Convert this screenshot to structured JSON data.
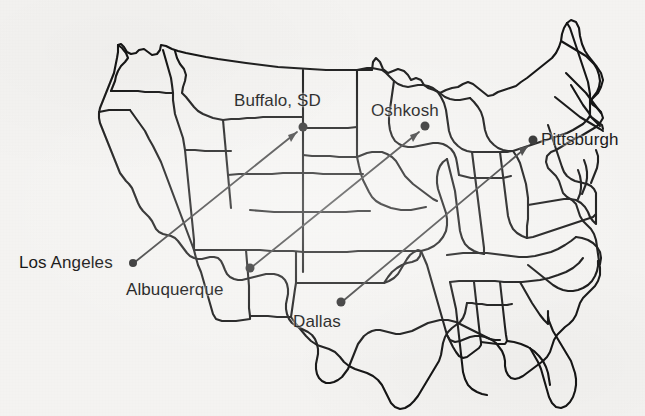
{
  "document": {
    "kind": "scanned-map-figure",
    "subject": "United States state outline map with city markers and directed route arrows",
    "background_color": "#f4f3f1",
    "ink_color": "#151515",
    "route_color": "#3c3c3c",
    "marker_color": "#2a2a2a",
    "width": 645,
    "height": 416
  },
  "cities": [
    {
      "id": "los-angeles",
      "label": "Los Angeles",
      "dot": {
        "x": 133,
        "y": 263
      },
      "label_pos": {
        "x": 19,
        "y": 254
      },
      "role": "origin"
    },
    {
      "id": "albuquerque",
      "label": "Albuquerque",
      "dot": {
        "x": 250,
        "y": 268
      },
      "label_pos": {
        "x": 126,
        "y": 281
      },
      "role": "origin"
    },
    {
      "id": "dallas",
      "label": "Dallas",
      "dot": {
        "x": 341,
        "y": 302
      },
      "label_pos": {
        "x": 293,
        "y": 313
      },
      "role": "origin"
    },
    {
      "id": "buffalo-sd",
      "label": "Buffalo, SD",
      "dot": {
        "x": 303,
        "y": 127
      },
      "label_pos": {
        "x": 234,
        "y": 92
      },
      "role": "destination"
    },
    {
      "id": "oshkosh",
      "label": "Oshkosh",
      "dot": {
        "x": 425,
        "y": 126
      },
      "label_pos": {
        "x": 371,
        "y": 102
      },
      "role": "destination"
    },
    {
      "id": "pittsburgh",
      "label": "Pittsburgh",
      "dot": {
        "x": 533,
        "y": 140
      },
      "label_pos": {
        "x": 541,
        "y": 131
      },
      "role": "destination"
    }
  ],
  "routes": [
    {
      "id": "la-to-buffalo",
      "from": "los-angeles",
      "to": "buffalo-sd",
      "from_point": {
        "x": 135,
        "y": 262
      },
      "to_point": {
        "x": 297,
        "y": 132
      }
    },
    {
      "id": "abq-to-oshkosh",
      "from": "albuquerque",
      "to": "oshkosh",
      "from_point": {
        "x": 252,
        "y": 267
      },
      "to_point": {
        "x": 419,
        "y": 132
      }
    },
    {
      "id": "dallas-to-pittsburgh",
      "from": "dallas",
      "to": "pittsburgh",
      "from_point": {
        "x": 343,
        "y": 301
      },
      "to_point": {
        "x": 528,
        "y": 146
      }
    }
  ]
}
